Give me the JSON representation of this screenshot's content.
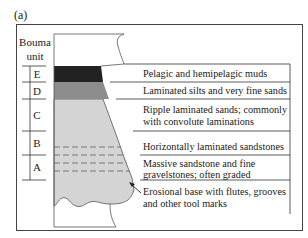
{
  "figure": {
    "label": "(a)",
    "unit_header_line1": "Bouma",
    "unit_header_line2": "unit"
  },
  "units": [
    {
      "id": "E",
      "label": "E",
      "color": "#222222",
      "description_lines": [
        "Pelagic and hemipelagic muds"
      ]
    },
    {
      "id": "D",
      "label": "D",
      "color": "#8c8c8c",
      "description_lines": [
        "Laminated silts and very fine sands"
      ]
    },
    {
      "id": "C",
      "label": "C",
      "color": "#d4d4d4",
      "description_lines": [
        "Ripple laminated sands; commonly",
        "with convolute laminations"
      ]
    },
    {
      "id": "B",
      "label": "B",
      "color": "#d4d4d4",
      "description_lines": [
        "Horizontally laminated sandstones"
      ]
    },
    {
      "id": "A",
      "label": "A",
      "color": "#d4d4d4",
      "description_lines": [
        "Massive sandstone and fine",
        "gravelstones; often graded"
      ]
    }
  ],
  "base_annotation": {
    "description_lines": [
      "Erosional base with flutes, grooves",
      "and other tool marks"
    ]
  }
}
